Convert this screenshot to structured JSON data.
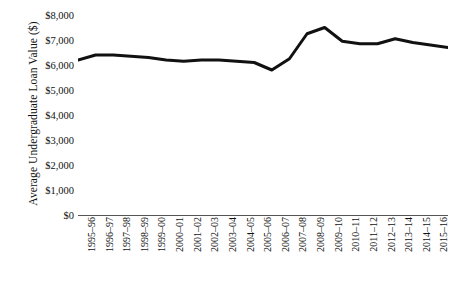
{
  "chart_data": {
    "type": "line",
    "title": "",
    "xlabel": "",
    "ylabel": "Average Undergraduate Loan Value ($)",
    "ylim": [
      0,
      8000
    ],
    "ytick_step": 1000,
    "ytick_labels": [
      "$8,000",
      "$7,000",
      "$6,000",
      "$5,000",
      "$4,000",
      "$3,000",
      "$2,000",
      "$1,000",
      "$0"
    ],
    "ytick_values": [
      8000,
      7000,
      6000,
      5000,
      4000,
      3000,
      2000,
      1000,
      0
    ],
    "grid": false,
    "legend": "none",
    "line_color": "#111111",
    "line_width": 3,
    "categories": [
      "1995–96",
      "1996–97",
      "1997–98",
      "1998–99",
      "1999–00",
      "2000–01",
      "2001–02",
      "2002–03",
      "2003–04",
      "2004–05",
      "2005–06",
      "2006–07",
      "2007–08",
      "2008–09",
      "2009–10",
      "2010–11",
      "2011–12",
      "2012–13",
      "2013–14",
      "2014–15",
      "2015–16",
      "2016–17 (est)"
    ],
    "values": [
      6200,
      6400,
      6400,
      6350,
      6300,
      6200,
      6150,
      6200,
      6200,
      6150,
      6100,
      5800,
      6250,
      7250,
      7500,
      6950,
      6850,
      6850,
      7050,
      6900,
      6800,
      6700
    ]
  }
}
